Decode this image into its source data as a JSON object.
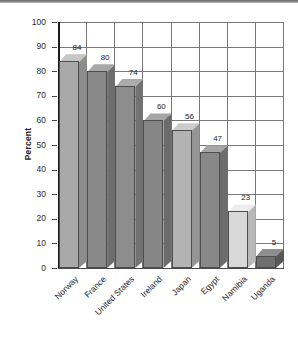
{
  "chart_data": {
    "type": "bar",
    "title": "",
    "subtitle": "",
    "xlabel": "",
    "ylabel": "Percent",
    "ylim": [
      0,
      100
    ],
    "ytick_step": 10,
    "yticks": [
      "100",
      "90",
      "80",
      "70",
      "60",
      "50",
      "40",
      "30",
      "20",
      "10",
      "0"
    ],
    "grid": true,
    "legend": "none",
    "orientation": "vertical",
    "style": "3d-bars",
    "categories": [
      "Norway",
      "France",
      "United States",
      "Ireland",
      "Japan",
      "Egypt",
      "Namibia",
      "Uganda"
    ],
    "values": [
      84,
      80,
      74,
      60,
      56,
      47,
      23,
      5
    ],
    "value_labels": [
      "84",
      "80",
      "74",
      "60",
      "56",
      "47",
      "23",
      "5"
    ],
    "bar_colors": [
      "#a9a9a9",
      "#898989",
      "#8d8d8d",
      "#868686",
      "#b3b3b3",
      "#888888",
      "#d8d8d8",
      "#6f6f6f"
    ],
    "bar_top_colors": [
      "#c6c6c6",
      "#a8a8a8",
      "#ababab",
      "#a5a5a5",
      "#cccccc",
      "#a7a7a7",
      "#ededed",
      "#8e8e8e"
    ],
    "bar_side_colors": [
      "#8c8c8c",
      "#6e6e6e",
      "#727272",
      "#6b6b6b",
      "#969696",
      "#6d6d6d",
      "#b9b9b9",
      "#575757"
    ],
    "accent_color": "#4d4d4d",
    "axis_color": "#1a1a1a",
    "grid_color": "#787878",
    "background": "#ffffff"
  }
}
